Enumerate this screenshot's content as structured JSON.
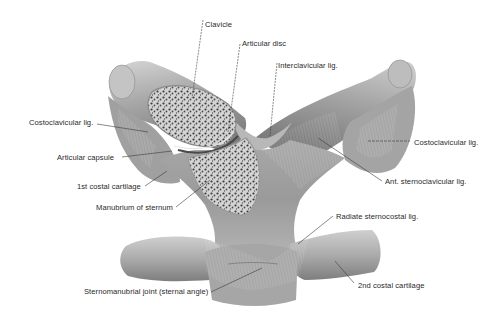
{
  "figure": {
    "background": "#ffffff",
    "colors": {
      "bone_light": "#c9c9c9",
      "bone_mid": "#9d9d9d",
      "bone_dark": "#6e6e6e",
      "cancellous": "#3f3f3f",
      "label_text": "#2a2a2a",
      "leader_line": "#3a3a3a"
    }
  },
  "labels": {
    "clavicle": "Clavicle",
    "articular_disc": "Articular disc",
    "interclavicular_lig": "Interclavicular lig.",
    "costoclavicular_lig_left": "Costoclavicular lig.",
    "costoclavicular_lig_right": "Costoclavicular lig.",
    "articular_capsule": "Articular capsule",
    "first_costal_cartilage": "1st costal cartilage",
    "ant_sternoclavicular_lig": "Ant. sternoclavicular lig.",
    "manubrium_of_sternum": "Manubrium of sternum",
    "radiate_sternocostal_lig": "Radiate sternocostal lig.",
    "sternomanubrial_joint": "Sternomanubrial joint (sternal angle)",
    "second_costal_cartilage": "2nd costal cartilage"
  }
}
